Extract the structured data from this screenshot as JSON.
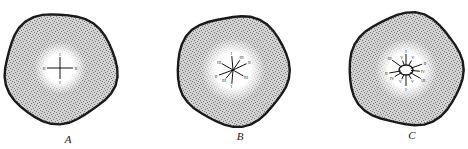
{
  "figure": {
    "panels": [
      {
        "id": "A",
        "caption": "A",
        "center": [
          60,
          68
        ],
        "outer_radius": 56,
        "inner_radius": 20,
        "arms": [
          {
            "label": "I",
            "angle": -90,
            "len": 11
          },
          {
            "label": "II",
            "angle": 0,
            "len": 13
          },
          {
            "label": "I",
            "angle": 90,
            "len": 11
          },
          {
            "label": "II",
            "angle": 180,
            "len": 13
          }
        ],
        "caption_pos": [
          68,
          144
        ]
      },
      {
        "id": "B",
        "caption": "B",
        "center": [
          233,
          70
        ],
        "outer_radius": 56,
        "inner_radius": 26,
        "arms": [
          {
            "label": "I",
            "angle": -95,
            "len": 14
          },
          {
            "label": "III",
            "angle": -55,
            "len": 12
          },
          {
            "label": "II",
            "angle": -25,
            "len": 15
          },
          {
            "label": "III",
            "angle": 30,
            "len": 12
          },
          {
            "label": "I",
            "angle": 95,
            "len": 14
          },
          {
            "label": "III",
            "angle": 130,
            "len": 11
          },
          {
            "label": "II",
            "angle": 160,
            "len": 15
          },
          {
            "label": "III",
            "angle": -150,
            "len": 13
          }
        ],
        "caption_pos": [
          240,
          141
        ]
      },
      {
        "id": "C",
        "caption": "C",
        "center": [
          406,
          70
        ],
        "outer_radius": 57,
        "inner_radius": 25,
        "arms": [
          {
            "label": "I",
            "angle": -90,
            "len": 16
          },
          {
            "label": "V",
            "angle": -110,
            "len": 10
          },
          {
            "label": "V",
            "angle": -60,
            "len": 11
          },
          {
            "label": "III",
            "angle": -145,
            "len": 17
          },
          {
            "label": "II",
            "angle": -20,
            "len": 17
          },
          {
            "label": "IV",
            "angle": 5,
            "len": 14
          },
          {
            "label": "III",
            "angle": 30,
            "len": 17
          },
          {
            "label": "V",
            "angle": 60,
            "len": 10
          },
          {
            "label": "I",
            "angle": 90,
            "len": 16
          },
          {
            "label": "V",
            "angle": 115,
            "len": 10
          },
          {
            "label": "IV",
            "angle": 150,
            "len": 13
          },
          {
            "label": "II",
            "angle": 170,
            "len": 17
          }
        ],
        "caption_pos": [
          412,
          140
        ]
      }
    ],
    "colors": {
      "rim": "#1a1a1a",
      "cortex": "#b8b8b8",
      "stele": "#f6f6f6",
      "arm": "#111111"
    }
  }
}
